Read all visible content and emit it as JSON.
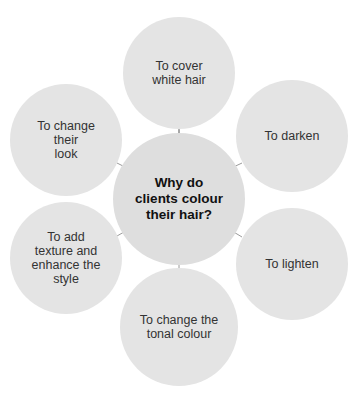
{
  "diagram": {
    "center": {
      "label": "Why do clients colour their hair?",
      "lines": [
        "Why do",
        "clients colour",
        "their hair?"
      ]
    },
    "nodes": [
      {
        "id": "top",
        "lines": [
          "To cover",
          "white hair"
        ]
      },
      {
        "id": "upper-right",
        "lines": [
          "To darken"
        ]
      },
      {
        "id": "lower-right",
        "lines": [
          "To lighten"
        ]
      },
      {
        "id": "bottom",
        "lines": [
          "To change the",
          "tonal colour"
        ]
      },
      {
        "id": "lower-left",
        "lines": [
          "To add",
          "texture and",
          "enhance the",
          "style"
        ]
      },
      {
        "id": "upper-left",
        "lines": [
          "To change",
          "their",
          "look"
        ]
      }
    ],
    "colors": {
      "circle_fill": "#e4e4e4",
      "connector": "#9a9a9a",
      "text": "#333333",
      "center_text": "#111111"
    }
  }
}
